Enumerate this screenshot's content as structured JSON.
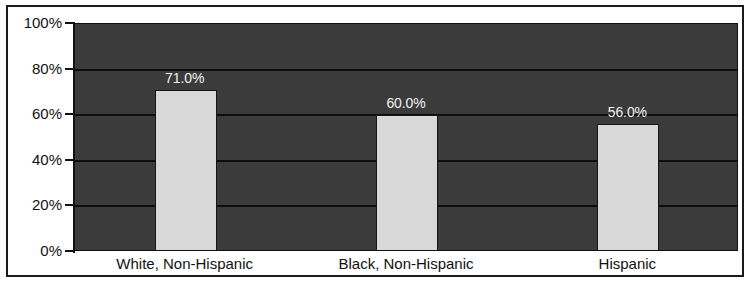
{
  "chart_data": {
    "type": "bar",
    "title": "",
    "subtitle": "",
    "xlabel": "",
    "ylabel": "",
    "categories": [
      "White, Non-Hispanic",
      "Black, Non-Hispanic",
      "Hispanic"
    ],
    "values": [
      71.0,
      60.0,
      56.0
    ],
    "value_labels": [
      "71.0%",
      "60.0%",
      "56.0%"
    ],
    "ylim": [
      0,
      100
    ],
    "yticks": [
      0,
      20,
      40,
      60,
      80,
      100
    ],
    "ytick_labels": [
      "0%",
      "20%",
      "40%",
      "60%",
      "80%",
      "100%"
    ],
    "grid": true,
    "legend": false,
    "legend_position": "none",
    "colors": {
      "plot_background": "#3b3b3b",
      "bar_fill": "#d9d9d9",
      "bar_border": "#151515",
      "gridline": "#0d0d0d",
      "axis_text": "#111111",
      "value_label_text": "#f2f2f2",
      "figure_background": "#ffffff",
      "frame_border": "#1a1a1a"
    }
  }
}
